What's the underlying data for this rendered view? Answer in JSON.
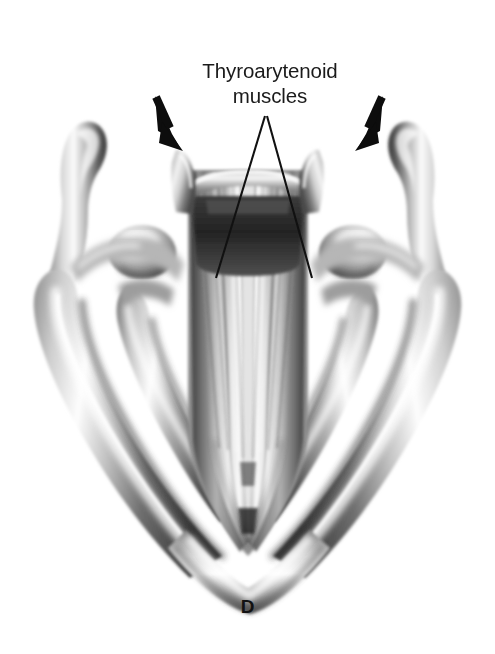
{
  "figure": {
    "panel_letter": "D",
    "label": "Thyroarytenoid\nmuscles",
    "label_lines": [
      "Thyroarytenoid",
      "muscles"
    ],
    "background_color": "#ffffff",
    "annotation_color": "#111111",
    "illustration": {
      "subject": "larynx-posterior-view-thyroid-cartilage-with-thyroarytenoid-muscles",
      "style": "grayscale-airbrush-medical-illustration",
      "tones": {
        "highlight": "#ffffff",
        "light": "#e2e2e2",
        "mid": "#a8a8a8",
        "shadow": "#6a6a6a",
        "deep_shadow": "#3a3a3a",
        "core": "#242424"
      }
    },
    "arrows": [
      {
        "name": "left-arrow",
        "tail": [
          157,
          98
        ],
        "tip": [
          179,
          148
        ],
        "direction": "down-right"
      },
      {
        "name": "right-arrow",
        "tail": [
          381,
          98
        ],
        "tip": [
          358,
          148
        ],
        "direction": "down-left"
      }
    ],
    "leader_lines": [
      {
        "name": "left-leader-line",
        "from": [
          265,
          116
        ],
        "to": [
          216,
          278
        ]
      },
      {
        "name": "right-leader-line",
        "from": [
          267,
          116
        ],
        "to": [
          312,
          278
        ]
      }
    ]
  }
}
